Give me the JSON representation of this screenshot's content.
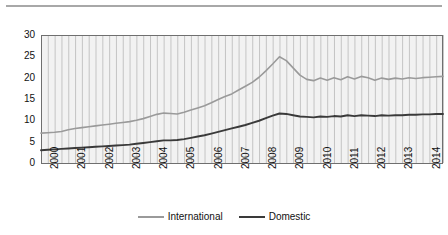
{
  "figure": {
    "top_rule": "horizontal-rule"
  },
  "legend": {
    "position": "bottom-center",
    "entries": [
      {
        "label": "International",
        "color": "#9a9a9a",
        "swatch": "line-swatch-international"
      },
      {
        "label": "Domestic",
        "color": "#3a3a3a",
        "swatch": "line-swatch-domestic"
      }
    ]
  },
  "axes": {
    "y_ticks": [
      "0",
      "5",
      "10",
      "15",
      "20",
      "25",
      "30"
    ],
    "x_ticks": [
      "2000",
      "2001",
      "2002",
      "2003",
      "2004",
      "2005",
      "2006",
      "2007",
      "2008",
      "2009",
      "2010",
      "2011",
      "2012",
      "2013",
      "2014"
    ]
  },
  "chart_data": {
    "type": "line",
    "title": "",
    "subtitle": "",
    "xlabel": "",
    "ylabel": "",
    "xlim": [
      2000,
      2014.75
    ],
    "ylim": [
      0,
      30
    ],
    "y_ticks": [
      0,
      5,
      10,
      15,
      20,
      25,
      30
    ],
    "grid": "vertical-only",
    "x_tick_labels": [
      "2000",
      "2001",
      "2002",
      "2003",
      "2004",
      "2005",
      "2006",
      "2007",
      "2008",
      "2009",
      "2010",
      "2011",
      "2012",
      "2013",
      "2014"
    ],
    "x": [
      2000.0,
      2000.25,
      2000.5,
      2000.75,
      2001.0,
      2001.25,
      2001.5,
      2001.75,
      2002.0,
      2002.25,
      2002.5,
      2002.75,
      2003.0,
      2003.25,
      2003.5,
      2003.75,
      2004.0,
      2004.25,
      2004.5,
      2004.75,
      2005.0,
      2005.25,
      2005.5,
      2005.75,
      2006.0,
      2006.25,
      2006.5,
      2006.75,
      2007.0,
      2007.25,
      2007.5,
      2007.75,
      2008.0,
      2008.25,
      2008.5,
      2008.75,
      2009.0,
      2009.25,
      2009.5,
      2009.75,
      2010.0,
      2010.25,
      2010.5,
      2010.75,
      2011.0,
      2011.25,
      2011.5,
      2011.75,
      2012.0,
      2012.25,
      2012.5,
      2012.75,
      2013.0,
      2013.25,
      2013.5,
      2013.75,
      2014.0,
      2014.25,
      2014.5,
      2014.75
    ],
    "series": [
      {
        "name": "International",
        "color": "#9a9a9a",
        "values": [
          7.0,
          7.1,
          7.2,
          7.4,
          7.8,
          8.1,
          8.3,
          8.5,
          8.7,
          8.9,
          9.1,
          9.3,
          9.5,
          9.7,
          10.0,
          10.4,
          10.9,
          11.4,
          11.7,
          11.6,
          11.5,
          11.9,
          12.4,
          12.9,
          13.4,
          14.1,
          14.9,
          15.6,
          16.2,
          17.1,
          18.0,
          18.9,
          20.1,
          21.6,
          23.2,
          24.9,
          24.0,
          22.3,
          20.6,
          19.6,
          19.3,
          19.9,
          19.4,
          20.0,
          19.5,
          20.2,
          19.7,
          20.3,
          20.0,
          19.4,
          19.9,
          19.6,
          19.9,
          19.7,
          20.0,
          19.8,
          20.0,
          20.1,
          20.2,
          20.3
        ]
      },
      {
        "name": "Domestic",
        "color": "#3a3a3a",
        "values": [
          3.0,
          3.1,
          3.2,
          3.3,
          3.4,
          3.5,
          3.6,
          3.7,
          3.8,
          3.9,
          4.0,
          4.1,
          4.2,
          4.3,
          4.5,
          4.7,
          4.9,
          5.1,
          5.3,
          5.3,
          5.4,
          5.6,
          5.9,
          6.2,
          6.5,
          6.9,
          7.3,
          7.7,
          8.1,
          8.5,
          8.9,
          9.4,
          9.9,
          10.5,
          11.1,
          11.6,
          11.5,
          11.2,
          10.9,
          10.8,
          10.7,
          10.9,
          10.8,
          11.0,
          10.9,
          11.2,
          11.0,
          11.2,
          11.1,
          11.0,
          11.2,
          11.1,
          11.2,
          11.2,
          11.3,
          11.3,
          11.4,
          11.4,
          11.5,
          11.5
        ]
      }
    ]
  }
}
